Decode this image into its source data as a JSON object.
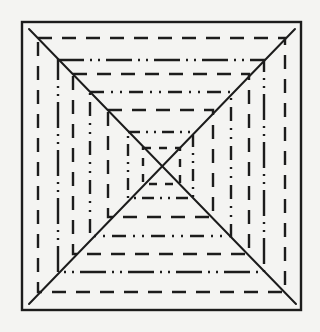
{
  "diagram": {
    "colors": {
      "background": "#f4f4f2",
      "ink": "#1c1c1c"
    },
    "frame": {
      "x1": 22,
      "y1": 22,
      "x2": 301,
      "y2": 310,
      "style": "solid"
    },
    "diagonals": [
      {
        "x1": 29,
        "y1": 29,
        "x2": 296,
        "y2": 304
      },
      {
        "x1": 295,
        "y1": 29,
        "x2": 29,
        "y2": 304
      }
    ],
    "squares": [
      {
        "x1": 38,
        "y1": 38,
        "x2": 285,
        "y2": 292,
        "style": "dashed",
        "dash": "14 10"
      },
      {
        "x1": 58,
        "y1": 60,
        "x2": 264,
        "y2": 272,
        "style": "dash-dot-dot",
        "dash": "26 6 2 6 2 6"
      },
      {
        "x1": 73,
        "y1": 74,
        "x2": 249,
        "y2": 254,
        "style": "dashed",
        "dash": "14 10"
      },
      {
        "x1": 90,
        "y1": 92,
        "x2": 231,
        "y2": 236,
        "style": "dash-dot-dot",
        "dash": "14 7 2 7 2 7"
      },
      {
        "x1": 108,
        "y1": 110,
        "x2": 213,
        "y2": 217,
        "style": "dashed",
        "dash": "14 10"
      },
      {
        "x1": 128,
        "y1": 132,
        "x2": 193,
        "y2": 198,
        "style": "dash-dot-dot",
        "dash": "12 6 2 6 2 6"
      },
      {
        "x1": 143,
        "y1": 148,
        "x2": 180,
        "y2": 184,
        "style": "dashed",
        "dash": "8 8"
      }
    ]
  }
}
